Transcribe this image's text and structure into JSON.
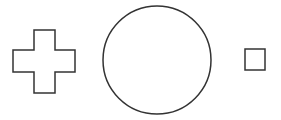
{
  "canvas": {
    "width": 281,
    "height": 120,
    "background": "#ffffff",
    "stroke_color": "#333333",
    "fill_color": "#ffffff"
  },
  "shapes": [
    {
      "type": "cross",
      "label": "cross",
      "points": "34,30 55,30 55,50 75,50 75,72 55,72 55,93 34,93 34,72 13,72 13,50 34,50"
    },
    {
      "type": "circle",
      "label": "circle",
      "cx": 157,
      "cy": 60,
      "r": 54
    },
    {
      "type": "square",
      "label": "square",
      "x": 245,
      "y": 49,
      "width": 20,
      "height": 21
    }
  ]
}
